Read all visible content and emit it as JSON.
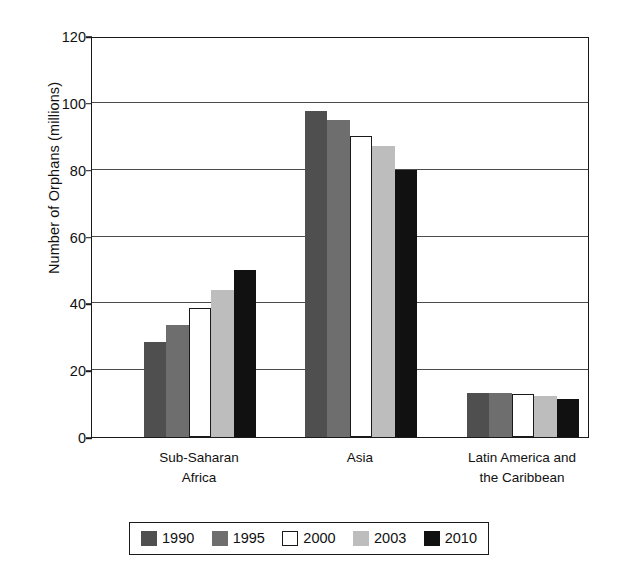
{
  "chart_data": {
    "type": "bar",
    "title": "",
    "xlabel": "",
    "ylabel": "Number of Orphans (millions)",
    "ylim": [
      0,
      120
    ],
    "ytick_values": [
      0,
      20,
      40,
      60,
      80,
      100,
      120
    ],
    "ytick_labels": [
      "0",
      "20",
      "40",
      "60",
      "80",
      "100",
      "120"
    ],
    "grid": "horizontal",
    "legend_position": "bottom",
    "categories": [
      "Sub-Saharan Africa",
      "Asia",
      "Latin America and the Caribbean"
    ],
    "category_lines": [
      [
        "Sub-Saharan",
        "Africa"
      ],
      [
        "Asia",
        ""
      ],
      [
        "Latin America and",
        "the Caribbean"
      ]
    ],
    "series": [
      {
        "name": "1990",
        "color": "#4f4f4f",
        "outlined": false,
        "values": [
          28.5,
          97.5,
          13.2
        ]
      },
      {
        "name": "1995",
        "color": "#6e6e6e",
        "outlined": false,
        "values": [
          33.5,
          95.0,
          13.2
        ]
      },
      {
        "name": "2000",
        "color": "#ffffff",
        "outlined": true,
        "values": [
          38.5,
          90.0,
          13.0
        ]
      },
      {
        "name": "2003",
        "color": "#bdbdbd",
        "outlined": false,
        "values": [
          44.0,
          87.0,
          12.2
        ]
      },
      {
        "name": "2010",
        "color": "#111111",
        "outlined": false,
        "values": [
          50.0,
          80.0,
          11.5
        ]
      }
    ]
  },
  "legend": {
    "items": [
      {
        "label": "1990"
      },
      {
        "label": "1995"
      },
      {
        "label": "2000"
      },
      {
        "label": "2003"
      },
      {
        "label": "2010"
      }
    ]
  },
  "colors": {
    "axis": "#1a1a1a",
    "gridline": "#4b4b4b",
    "background": "#ffffff",
    "text": "#111111"
  }
}
